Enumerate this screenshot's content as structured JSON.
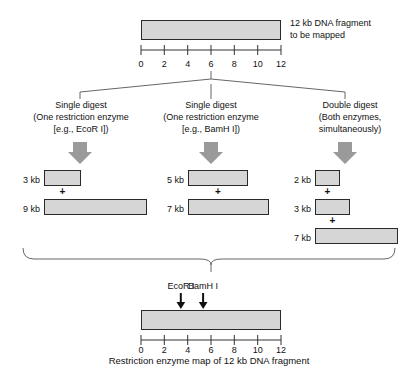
{
  "figure": {
    "caption": "Restriction enzyme map of 12 kb DNA fragment",
    "source_label": "12 kb DNA fragment\nto be mapped"
  },
  "top_fragment": {
    "label_line1": "12 kb DNA fragment",
    "label_line2": "to be mapped",
    "length_kb": 12,
    "axis": {
      "ticks": [
        "0",
        "2",
        "4",
        "6",
        "8",
        "10",
        "12"
      ],
      "tick_values": [
        0,
        2,
        4,
        6,
        8,
        10,
        12
      ],
      "min": 0,
      "max": 12
    }
  },
  "columns": [
    {
      "id": "single-digest-ecori",
      "title": "Single digest",
      "subtitle_line1": "(One restriction enzyme",
      "subtitle_line2": "[e.g., EcoR I])",
      "enzyme": "EcoR I",
      "arrow": "down-arrow",
      "fragments": [
        {
          "label": "3 kb",
          "size_kb": 3
        },
        {
          "label": "9 kb",
          "size_kb": 9
        }
      ],
      "separators": [
        "+"
      ]
    },
    {
      "id": "single-digest-bamhi",
      "title": "Single digest",
      "subtitle_line1": "(One restriction enzyme",
      "subtitle_line2": "[e.g., BamH I])",
      "enzyme": "BamH I",
      "arrow": "down-arrow",
      "fragments": [
        {
          "label": "5 kb",
          "size_kb": 5
        },
        {
          "label": "7 kb",
          "size_kb": 7
        }
      ],
      "separators": [
        "+"
      ]
    },
    {
      "id": "double-digest",
      "title": "Double digest",
      "subtitle_line1": "(Both enzymes,",
      "subtitle_line2": "simultaneously)",
      "enzyme": "EcoR I + BamH I",
      "arrow": "down-arrow",
      "fragments": [
        {
          "label": "2 kb",
          "size_kb": 2
        },
        {
          "label": "3 kb",
          "size_kb": 3
        },
        {
          "label": "7 kb",
          "size_kb": 7
        }
      ],
      "separators": [
        "+",
        "+"
      ]
    }
  ],
  "map": {
    "length_kb": 12,
    "axis": {
      "ticks": [
        "0",
        "2",
        "4",
        "6",
        "8",
        "10",
        "12"
      ],
      "tick_values": [
        0,
        2,
        4,
        6,
        8,
        10,
        12
      ],
      "min": 0,
      "max": 12
    },
    "sites": [
      {
        "label": "EcoR I",
        "position_kb": 3,
        "marker": "down-arrow"
      },
      {
        "label": "BamH I",
        "position_kb": 5,
        "marker": "down-arrow"
      }
    ],
    "caption": "Restriction enzyme map of 12 kb DNA fragment"
  },
  "colors": {
    "bar_fill": "#d6d6d6",
    "bar_stroke": "#2a2a2a",
    "arrow_fill": "#9a9a9a",
    "line": "#555555",
    "text": "#111111"
  }
}
